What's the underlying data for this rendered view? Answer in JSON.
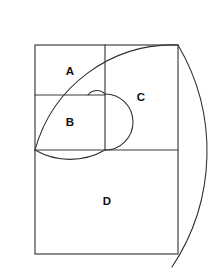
{
  "figure": {
    "type": "geometric-diagram",
    "canvas": {
      "width": 220,
      "height": 280
    },
    "background_color": "#ffffff",
    "line_color": "#3a3a3a",
    "spiral_color": "#2e2e2e",
    "label_color": "#101010"
  },
  "labels": {
    "a": "A",
    "b": "B",
    "c": "C",
    "d": "D"
  },
  "label_positions": {
    "a": {
      "x": 70,
      "y": 72
    },
    "b": {
      "x": 70,
      "y": 123
    },
    "c": {
      "x": 141,
      "y": 98
    },
    "d": {
      "x": 107,
      "y": 202
    }
  },
  "rectangles": [
    {
      "name": "outer-frame",
      "x": 35,
      "y": 45,
      "width": 143,
      "height": 209
    },
    {
      "name": "rect-d",
      "x": 35,
      "y": 150,
      "width": 143,
      "height": 104
    },
    {
      "name": "rect-c",
      "x": 105,
      "y": 45,
      "width": 73,
      "height": 105
    },
    {
      "name": "rect-a",
      "x": 35,
      "y": 45,
      "width": 70,
      "height": 50
    },
    {
      "name": "rect-b",
      "x": 35,
      "y": 95,
      "width": 70,
      "height": 55
    }
  ],
  "dividers": [
    {
      "name": "divider-horizontal-d",
      "x1": 35,
      "y1": 150,
      "x2": 178,
      "y2": 150
    },
    {
      "name": "divider-vertical-c",
      "x1": 105,
      "y1": 45,
      "x2": 105,
      "y2": 150
    },
    {
      "name": "divider-horizontal-ab",
      "x1": 35,
      "y1": 95,
      "x2": 105,
      "y2": 95
    }
  ],
  "spiral_arcs": [
    {
      "name": "arc-d-outer",
      "from": {
        "x": 35,
        "y": 150
      },
      "to": {
        "x": 178,
        "y": 254
      },
      "radius": 143,
      "center": {
        "x": 178,
        "y": 150
      },
      "sweep": 1
    },
    {
      "name": "arc-c",
      "from": {
        "x": 178,
        "y": 150
      },
      "to": {
        "x": 105,
        "y": 150
      },
      "radius": 105,
      "center": {
        "x": 105,
        "y": 150
      },
      "sweep": 0
    },
    {
      "name": "arc-b",
      "from": {
        "x": 105,
        "y": 150
      },
      "to": {
        "x": 105,
        "y": 95
      },
      "radius": 70,
      "center": {
        "x": 105,
        "y": 95
      },
      "sweep": 1
    },
    {
      "name": "arc-a",
      "from": {
        "x": 35,
        "y": 95
      },
      "to": {
        "x": 105,
        "y": 95
      },
      "radius": 50,
      "center": {
        "x": 105,
        "y": 95
      },
      "sweep": 1
    }
  ]
}
